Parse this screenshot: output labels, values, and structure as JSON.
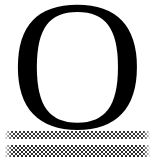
{
  "page": {
    "name": "scanned-initial-letter-page",
    "background_color": "#ffffff",
    "width": 155,
    "height": 161
  },
  "dropcap": {
    "character": "O",
    "description": "large black serif capital letter O",
    "typeface_style": "serif",
    "color": "#000000"
  },
  "rules": [
    {
      "id": "halftone-rule-top",
      "label": "halftone rule",
      "pattern": "checkerboard-dither",
      "tone": "50% gray",
      "color": "#1a1a1a",
      "thickness_px": 8
    },
    {
      "id": "halftone-rule-bottom",
      "label": "halftone rule",
      "pattern": "checkerboard-dither",
      "tone": "50% gray",
      "color": "#1a1a1a",
      "thickness_px": 12
    }
  ]
}
